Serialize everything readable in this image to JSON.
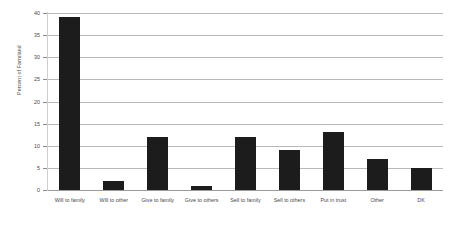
{
  "chart_data": {
    "type": "bar",
    "title": "",
    "subtitle": "",
    "xlabel": "",
    "ylabel": "Percent of Farmland",
    "ylim": [
      0,
      40
    ],
    "ytick_step": 5,
    "yticks": [
      "0",
      "5",
      "10",
      "15",
      "20",
      "25",
      "30",
      "35",
      "40"
    ],
    "ytick_values": [
      0,
      5,
      10,
      15,
      20,
      25,
      30,
      35,
      40
    ],
    "grid": "horizontal",
    "legend": "none",
    "categories": [
      "Will to family",
      "Will to other",
      "Give to family",
      "Give to others",
      "Sell to family",
      "Sell to others",
      "Put in trust",
      "Other",
      "DK"
    ],
    "values": [
      39,
      2,
      12,
      1,
      12,
      9,
      13,
      7,
      5
    ],
    "series": [
      {
        "name": "Percent of Farmland",
        "values": [
          39,
          2,
          12,
          1,
          12,
          9,
          13,
          7,
          5
        ]
      }
    ],
    "colors": {
      "bar": "#1c1c1c",
      "gridline": "#b9b9b9",
      "axis": "#9a9a9a",
      "text": "#4a4a4a",
      "background": "#ffffff"
    }
  }
}
